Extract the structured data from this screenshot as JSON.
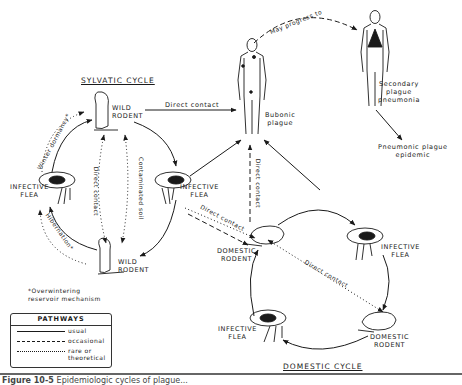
{
  "figure": {
    "caption_number": "Figure 10-5",
    "caption_text": "Epidemiologic cycles of plague..."
  },
  "cycles": {
    "sylvatic_title": "SYLVATIC CYCLE",
    "domestic_title": "DOMESTIC CYCLE"
  },
  "nodes": {
    "wild_rodent_top": "WILD\nRODENT",
    "wild_rodent_bottom": "WILD\nRODENT",
    "infective_flea_sylvatic_left": "INFECTIVE\nFLEA",
    "infective_flea_sylvatic_right": "INFECTIVE\nFLEA",
    "domestic_rodent_left": "DOMESTIC\nRODENT",
    "domestic_rodent_right": "DOMESTIC\nRODENT",
    "infective_flea_domestic_right": "INFECTIVE\nFLEA",
    "infective_flea_domestic_left": "INFECTIVE\nFLEA",
    "bubonic_plague": "Bubonic\nplague",
    "secondary_pneumonia": "Secondary\nplague\npneumonia",
    "pneumonic_epidemic": "Pneumonic plague\nepidemic"
  },
  "edge_labels": {
    "direct_contact_top": "Direct contact",
    "may_progress_to": "May progress to",
    "winter_dormancy": "Winter dormancy*",
    "hibernation": "Hibernation*",
    "direct_contact_sylvatic": "Direct contact",
    "contaminated_soil": "Contaminated soil",
    "direct_contact_vertical": "Direct contact",
    "direct_contact_flea_domestic": "Direct contact",
    "direct_contact_domestic_diag": "Direct contact"
  },
  "footnote": "*Overwintering\nreservoir mechanism",
  "legend": {
    "title": "PATHWAYS",
    "items": [
      {
        "style": "solid",
        "label": "usual"
      },
      {
        "style": "dashed",
        "label": "occasional"
      },
      {
        "style": "dotted",
        "label": "rare or\ntheoretical"
      }
    ]
  },
  "colors": {
    "ink": "#1a1a1a",
    "background": "#ffffff",
    "caption_rule": "#666666"
  }
}
